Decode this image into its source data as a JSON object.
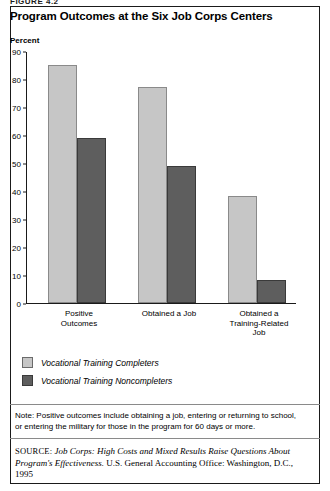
{
  "figure": {
    "label": "FIGURE 4.2",
    "title": "Program Outcomes at the Six Job Corps Centers",
    "axis_unit": "Percent"
  },
  "chart_data": {
    "type": "bar",
    "title": "Program Outcomes at the Six Job Corps Centers",
    "xlabel": "",
    "ylabel": "Percent",
    "ylim": [
      0,
      90
    ],
    "yticks": [
      0,
      10,
      20,
      30,
      40,
      50,
      60,
      70,
      80,
      90
    ],
    "grid": false,
    "legend_position": "below-plot-left",
    "categories": [
      "Positive Outcomes",
      "Obtained a Job",
      "Obtained a Training-Related Job"
    ],
    "category_lines": [
      [
        "Positive",
        "Outcomes"
      ],
      [
        "Obtained a Job"
      ],
      [
        "Obtained a",
        "Training-Related",
        "Job"
      ]
    ],
    "series": [
      {
        "name": "Vocational Training Completers",
        "color": "#c6c6c6",
        "values": [
          85,
          77,
          38
        ]
      },
      {
        "name": "Vocational Training Noncompleters",
        "color": "#5e5e5e",
        "values": [
          59,
          49,
          8
        ]
      }
    ]
  },
  "note": {
    "lead": "Note:",
    "text": "Positive outcomes include obtaining a job, entering or returning to school, or entering the military for those in the program for 60 days or more."
  },
  "source": {
    "label": "SOURCE:",
    "title": "Job Corps: High Costs and Mixed Results Raise Questions About Program's Effectiveness.",
    "publisher": " U.S. General Accounting Office: Washington, D.C., 1995"
  }
}
